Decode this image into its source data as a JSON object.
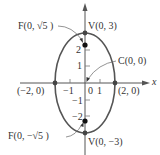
{
  "diagram": {
    "type": "ellipse",
    "equation_center": [
      0,
      0
    ],
    "labels": {
      "focus_top": "F(0, √5 )",
      "vertex_top": "V(0, 3)",
      "center": "C(0, 0)",
      "vertex_left": "(−2, 0)",
      "vertex_right": "(2, 0)",
      "focus_bottom": "F(0, −√5 )",
      "vertex_bottom": "V(0, −3)",
      "x_axis": "x"
    },
    "ticks": {
      "x_neg1": "−1",
      "x_0": "0",
      "x_1": "1",
      "y_2": "2",
      "y_1": "1",
      "y_neg1": "−1",
      "y_neg2": "−2"
    },
    "points": {
      "vertices": [
        [
          0,
          3
        ],
        [
          0,
          -3
        ],
        [
          -2,
          0
        ],
        [
          2,
          0
        ]
      ],
      "foci": [
        [
          0,
          2.236
        ],
        [
          0,
          -2.236
        ]
      ],
      "center": [
        0,
        0
      ]
    },
    "semi_axes": {
      "a": 3,
      "b": 2
    },
    "colors": {
      "curve": "#555555",
      "axes": "#555555",
      "points": "#222222",
      "text": "#333333"
    }
  }
}
